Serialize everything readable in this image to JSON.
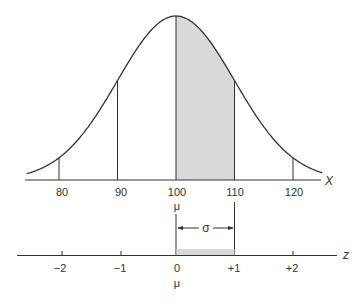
{
  "chart_data": {
    "type": "area",
    "title": "",
    "x_axis": {
      "label": "X",
      "ticks": [
        80,
        90,
        100,
        110,
        120
      ],
      "mu_label_at": 100
    },
    "z_axis": {
      "label": "z",
      "ticks": [
        "−2",
        "−1",
        "0",
        "+1",
        "+2"
      ],
      "mu_label_at": "0"
    },
    "distribution": {
      "mean": 100,
      "sd": 10
    },
    "shaded_region": {
      "from": 100,
      "to": 110
    },
    "annotation": "σ"
  },
  "labels": {
    "x_axis_label": "X",
    "z_axis_label": "z",
    "mu_upper": "μ",
    "mu_lower": "μ",
    "sigma": "σ",
    "x_ticks": [
      "80",
      "90",
      "100",
      "110",
      "120"
    ],
    "z_ticks": [
      "−2",
      "−1",
      "0",
      "+1",
      "+2"
    ]
  },
  "colors": {
    "shade": "#d9d9d9",
    "line": "#333333"
  }
}
